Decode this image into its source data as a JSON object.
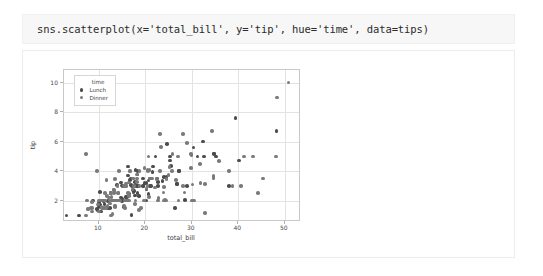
{
  "code_cell": {
    "source": "sns.scatterplot(x='total_bill', y='tip', hue='time', data=tips)"
  },
  "chart_data": {
    "type": "scatter",
    "title": "",
    "xlabel": "total_bill",
    "ylabel": "tip",
    "xlim": [
      2.5,
      53.5
    ],
    "ylim": [
      0.55,
      10.85
    ],
    "xticks": [
      10,
      20,
      30,
      40,
      50
    ],
    "yticks": [
      2,
      4,
      6,
      8,
      10
    ],
    "grid": true,
    "legend": {
      "title": "time",
      "position": "upper left",
      "entries": [
        {
          "name": "Lunch",
          "color": "#4c4c4c"
        },
        {
          "name": "Dinner",
          "color": "#7a7a7a"
        }
      ]
    },
    "series": [
      {
        "name": "Lunch",
        "color": "#4c4c4c",
        "points": [
          [
            16.99,
            1.01
          ],
          [
            10.34,
            1.66
          ],
          [
            21.01,
            3.5
          ],
          [
            23.68,
            3.31
          ],
          [
            24.59,
            3.61
          ],
          [
            25.29,
            4.71
          ],
          [
            8.77,
            2.0
          ],
          [
            26.88,
            3.12
          ],
          [
            15.04,
            1.96
          ],
          [
            14.78,
            3.23
          ],
          [
            10.27,
            1.71
          ],
          [
            35.26,
            5.0
          ],
          [
            15.42,
            1.57
          ],
          [
            18.43,
            3.0
          ],
          [
            14.83,
            3.02
          ],
          [
            21.58,
            3.92
          ],
          [
            10.33,
            1.67
          ],
          [
            16.29,
            3.71
          ],
          [
            16.97,
            3.5
          ],
          [
            20.65,
            3.35
          ],
          [
            17.92,
            4.08
          ],
          [
            20.29,
            2.75
          ],
          [
            15.77,
            2.23
          ],
          [
            39.42,
            7.58
          ],
          [
            19.82,
            3.18
          ],
          [
            17.81,
            2.34
          ],
          [
            13.37,
            2.0
          ],
          [
            12.69,
            2.0
          ],
          [
            21.7,
            4.3
          ],
          [
            19.65,
            3.0
          ],
          [
            9.55,
            1.45
          ],
          [
            18.35,
            2.5
          ],
          [
            15.06,
            3.0
          ],
          [
            20.69,
            2.45
          ],
          [
            17.78,
            3.27
          ],
          [
            24.06,
            3.6
          ],
          [
            16.31,
            2.0
          ],
          [
            16.93,
            3.07
          ],
          [
            18.69,
            2.31
          ],
          [
            31.27,
            5.0
          ],
          [
            16.04,
            2.24
          ],
          [
            17.46,
            2.54
          ],
          [
            13.94,
            3.06
          ],
          [
            9.68,
            1.32
          ],
          [
            30.4,
            5.6
          ],
          [
            18.29,
            3.0
          ],
          [
            22.23,
            5.0
          ],
          [
            32.4,
            6.0
          ],
          [
            28.55,
            2.05
          ],
          [
            18.04,
            3.0
          ],
          [
            12.54,
            2.5
          ],
          [
            10.29,
            2.6
          ],
          [
            34.81,
            5.2
          ],
          [
            9.94,
            1.56
          ],
          [
            25.56,
            4.34
          ],
          [
            19.49,
            3.51
          ],
          [
            38.01,
            3.0
          ],
          [
            26.41,
            1.5
          ],
          [
            11.24,
            1.76
          ],
          [
            48.27,
            6.73
          ],
          [
            20.29,
            3.21
          ],
          [
            13.81,
            2.0
          ],
          [
            11.02,
            1.98
          ],
          [
            18.29,
            3.76
          ],
          [
            17.59,
            2.64
          ],
          [
            20.08,
            3.15
          ],
          [
            16.45,
            2.47
          ],
          [
            3.07,
            1.0
          ],
          [
            20.23,
            2.01
          ],
          [
            15.01,
            2.09
          ],
          [
            12.02,
            1.97
          ],
          [
            17.07,
            3.0
          ],
          [
            26.86,
            3.14
          ],
          [
            25.28,
            5.0
          ],
          [
            14.73,
            2.2
          ],
          [
            10.51,
            1.25
          ],
          [
            17.92,
            3.08
          ],
          [
            27.2,
            4.0
          ],
          [
            22.76,
            3.0
          ],
          [
            17.29,
            2.71
          ],
          [
            19.44,
            3.0
          ],
          [
            16.66,
            3.4
          ],
          [
            10.07,
            1.83
          ],
          [
            32.68,
            5.0
          ],
          [
            15.98,
            2.03
          ],
          [
            34.83,
            5.17
          ],
          [
            13.03,
            2.0
          ],
          [
            18.28,
            4.0
          ],
          [
            24.71,
            5.85
          ],
          [
            21.16,
            3.0
          ],
          [
            28.97,
            3.0
          ],
          [
            22.49,
            3.5
          ],
          [
            5.75,
            1.0
          ],
          [
            16.32,
            4.3
          ],
          [
            22.75,
            3.25
          ],
          [
            40.17,
            4.73
          ],
          [
            27.28,
            4.0
          ],
          [
            12.03,
            1.5
          ],
          [
            21.01,
            3.0
          ],
          [
            12.46,
            1.5
          ]
        ]
      },
      {
        "name": "Dinner",
        "color": "#7a7a7a",
        "points": [
          [
            11.35,
            2.5
          ],
          [
            15.38,
            3.0
          ],
          [
            44.3,
            2.5
          ],
          [
            22.42,
            3.48
          ],
          [
            20.92,
            4.08
          ],
          [
            15.36,
            1.64
          ],
          [
            20.49,
            4.06
          ],
          [
            25.21,
            4.29
          ],
          [
            18.24,
            3.76
          ],
          [
            14.31,
            4.0
          ],
          [
            14.0,
            3.0
          ],
          [
            7.25,
            1.0
          ],
          [
            38.07,
            4.0
          ],
          [
            23.95,
            2.55
          ],
          [
            25.71,
            4.0
          ],
          [
            17.31,
            3.5
          ],
          [
            29.93,
            5.07
          ],
          [
            10.65,
            1.5
          ],
          [
            12.43,
            1.8
          ],
          [
            24.08,
            2.92
          ],
          [
            11.69,
            2.31
          ],
          [
            13.42,
            1.68
          ],
          [
            14.26,
            2.5
          ],
          [
            15.95,
            2.0
          ],
          [
            12.48,
            2.52
          ],
          [
            29.8,
            4.2
          ],
          [
            8.52,
            1.48
          ],
          [
            14.52,
            2.0
          ],
          [
            11.38,
            2.0
          ],
          [
            22.82,
            2.18
          ],
          [
            19.08,
            1.5
          ],
          [
            20.27,
            2.83
          ],
          [
            11.17,
            1.5
          ],
          [
            12.26,
            2.0
          ],
          [
            18.26,
            3.25
          ],
          [
            8.51,
            1.25
          ],
          [
            10.33,
            2.0
          ],
          [
            14.15,
            2.0
          ],
          [
            16.0,
            2.0
          ],
          [
            13.16,
            2.75
          ],
          [
            17.47,
            3.5
          ],
          [
            34.3,
            6.7
          ],
          [
            41.19,
            5.0
          ],
          [
            27.05,
            5.0
          ],
          [
            16.43,
            2.3
          ],
          [
            8.35,
            1.5
          ],
          [
            18.64,
            1.36
          ],
          [
            11.87,
            1.63
          ],
          [
            9.78,
            1.73
          ],
          [
            7.51,
            2.0
          ],
          [
            14.07,
            2.5
          ],
          [
            13.13,
            2.0
          ],
          [
            17.26,
            2.74
          ],
          [
            24.55,
            2.0
          ],
          [
            19.77,
            2.0
          ],
          [
            29.85,
            5.14
          ],
          [
            48.17,
            5.0
          ],
          [
            25.0,
            3.75
          ],
          [
            13.39,
            2.61
          ],
          [
            16.49,
            2.0
          ],
          [
            21.5,
            3.5
          ],
          [
            12.66,
            2.5
          ],
          [
            16.21,
            2.0
          ],
          [
            13.81,
            2.0
          ],
          [
            17.51,
            3.0
          ],
          [
            24.52,
            3.48
          ],
          [
            20.76,
            2.24
          ],
          [
            31.71,
            4.5
          ],
          [
            10.59,
            1.61
          ],
          [
            10.63,
            2.0
          ],
          [
            50.81,
            10.0
          ],
          [
            15.81,
            3.16
          ],
          [
            7.25,
            5.15
          ],
          [
            31.85,
            3.18
          ],
          [
            16.82,
            4.0
          ],
          [
            32.9,
            3.11
          ],
          [
            17.89,
            2.0
          ],
          [
            14.48,
            2.0
          ],
          [
            9.6,
            4.0
          ],
          [
            34.63,
            3.55
          ],
          [
            34.65,
            3.68
          ],
          [
            23.33,
            5.65
          ],
          [
            45.35,
            3.5
          ],
          [
            23.17,
            6.5
          ],
          [
            40.55,
            3.0
          ],
          [
            20.69,
            5.0
          ],
          [
            20.9,
            3.5
          ],
          [
            30.46,
            2.0
          ],
          [
            18.15,
            3.5
          ],
          [
            23.1,
            4.0
          ],
          [
            15.69,
            1.5
          ],
          [
            19.81,
            4.19
          ],
          [
            28.44,
            2.56
          ],
          [
            15.48,
            2.02
          ],
          [
            16.58,
            4.0
          ],
          [
            7.56,
            1.44
          ],
          [
            10.34,
            2.0
          ],
          [
            43.11,
            5.0
          ],
          [
            13.0,
            2.0
          ],
          [
            13.51,
            2.0
          ],
          [
            18.71,
            4.0
          ],
          [
            12.74,
            2.01
          ],
          [
            13.0,
            2.0
          ],
          [
            16.4,
            2.5
          ],
          [
            20.53,
            4.0
          ],
          [
            16.47,
            3.23
          ],
          [
            26.59,
            3.41
          ],
          [
            38.73,
            3.0
          ],
          [
            24.27,
            2.03
          ],
          [
            12.76,
            2.23
          ],
          [
            30.06,
            2.0
          ],
          [
            25.89,
            5.16
          ],
          [
            48.33,
            9.0
          ],
          [
            13.27,
            2.5
          ],
          [
            28.17,
            6.5
          ],
          [
            12.9,
            1.1
          ],
          [
            28.15,
            3.0
          ],
          [
            11.59,
            1.5
          ],
          [
            7.74,
            1.44
          ],
          [
            30.14,
            3.09
          ],
          [
            12.16,
            2.2
          ],
          [
            13.42,
            3.48
          ],
          [
            8.58,
            1.92
          ],
          [
            15.98,
            3.0
          ],
          [
            13.42,
            1.58
          ],
          [
            16.27,
            2.5
          ],
          [
            10.09,
            2.0
          ],
          [
            20.45,
            3.0
          ],
          [
            13.28,
            2.72
          ],
          [
            22.12,
            2.88
          ],
          [
            24.01,
            2.0
          ],
          [
            15.69,
            3.0
          ],
          [
            11.61,
            3.39
          ],
          [
            10.77,
            1.47
          ],
          [
            15.53,
            3.0
          ],
          [
            10.07,
            1.25
          ],
          [
            12.6,
            1.0
          ],
          [
            32.83,
            1.17
          ],
          [
            35.83,
            4.67
          ],
          [
            29.03,
            5.92
          ],
          [
            27.18,
            2.0
          ],
          [
            22.67,
            2.0
          ],
          [
            17.82,
            1.75
          ],
          [
            18.78,
            3.0
          ]
        ]
      }
    ]
  }
}
